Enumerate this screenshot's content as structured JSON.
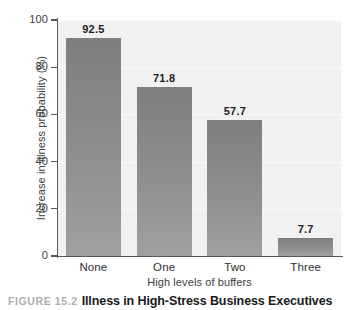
{
  "chart_data": {
    "type": "bar",
    "title": "Illness in High-Stress Business Executives",
    "figure_number": "FIGURE 15.2",
    "categories": [
      "None",
      "One",
      "Two",
      "Three"
    ],
    "values": [
      92.5,
      71.8,
      57.7,
      7.7
    ],
    "value_labels": [
      "92.5",
      "71.8",
      "57.7",
      "7.7"
    ],
    "xlabel": "High levels of buffers",
    "ylabel": "Increase in illness probability (%)",
    "ylim": [
      0,
      100
    ],
    "ytick_labels": [
      "0",
      "20",
      "40",
      "60",
      "80",
      "100"
    ],
    "ytick_values": [
      0,
      20,
      40,
      60,
      80,
      100
    ],
    "grid": true,
    "legend": "none",
    "colors": {
      "bar_top": "#7e7e7e",
      "bar_bottom": "#a0a0a0",
      "plot_background": "#f1f1f1",
      "gridline": "#fbfbfb",
      "axis": "#58585a",
      "axis_text": "#3d3d3d",
      "value_label": "#1d1d1d",
      "caption_number": "#adadad",
      "caption_title": "#1a1a1a"
    }
  }
}
